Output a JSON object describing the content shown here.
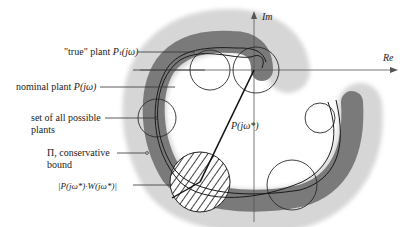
{
  "axes": {
    "imaginary_label": "Im",
    "real_label": "Re"
  },
  "labels": {
    "true_plant": "\"true\" plant",
    "true_plant_symbol": "Pₜ(jω)",
    "nominal_plant": "nominal plant",
    "nominal_plant_symbol": "P(jω)",
    "set_of_plants_line1": "set of all possible",
    "set_of_plants_line2": "plants",
    "pi_line1": "Π, conservative",
    "pi_line2": "bound",
    "uncertainty_radius": "|P(jω*)·W(jω*)|",
    "vector_label": "P(jω*)"
  },
  "colors": {
    "outer_band": "#d4d4d4",
    "inner_band": "#7a7a7a",
    "curve": "#1a1a1a",
    "axis": "#555555"
  }
}
